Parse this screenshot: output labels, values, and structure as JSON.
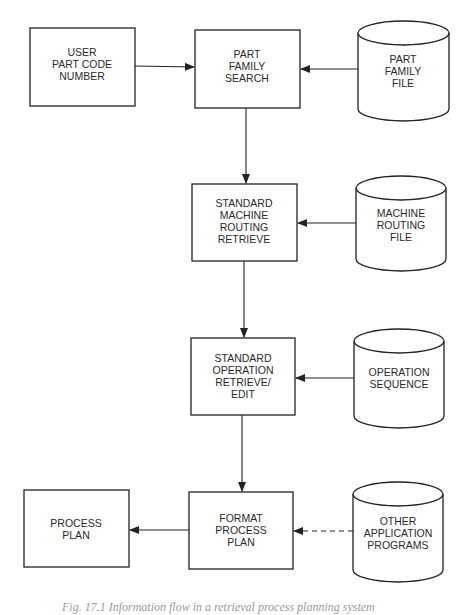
{
  "diagram": {
    "type": "flowchart",
    "nodes": [
      {
        "id": "user_part_code",
        "shape": "process",
        "lines": [
          "USER",
          "PART CODE",
          "NUMBER"
        ]
      },
      {
        "id": "part_family_search",
        "shape": "process",
        "lines": [
          "PART",
          "FAMILY",
          "SEARCH"
        ]
      },
      {
        "id": "part_family_file",
        "shape": "database",
        "lines": [
          "PART",
          "FAMILY",
          "FILE"
        ]
      },
      {
        "id": "std_machine_routing",
        "shape": "process",
        "lines": [
          "STANDARD",
          "MACHINE",
          "ROUTING",
          "RETRIEVE"
        ]
      },
      {
        "id": "machine_routing_file",
        "shape": "database",
        "lines": [
          "MACHINE",
          "ROUTING",
          "FILE"
        ]
      },
      {
        "id": "std_operation",
        "shape": "process",
        "lines": [
          "STANDARD",
          "OPERATION",
          "RETRIEVE/",
          "EDIT"
        ]
      },
      {
        "id": "operation_sequence",
        "shape": "database",
        "lines": [
          "OPERATION",
          "SEQUENCE"
        ]
      },
      {
        "id": "process_plan",
        "shape": "process",
        "lines": [
          "PROCESS",
          "PLAN"
        ]
      },
      {
        "id": "format_process_plan",
        "shape": "process",
        "lines": [
          "FORMAT",
          "PROCESS",
          "PLAN"
        ]
      },
      {
        "id": "other_app_programs",
        "shape": "database",
        "lines": [
          "OTHER",
          "APPLICATION",
          "PROGRAMS"
        ]
      }
    ],
    "edges": [
      {
        "from": "user_part_code",
        "to": "part_family_search",
        "style": "solid"
      },
      {
        "from": "part_family_file",
        "to": "part_family_search",
        "style": "solid"
      },
      {
        "from": "part_family_search",
        "to": "std_machine_routing",
        "style": "solid"
      },
      {
        "from": "machine_routing_file",
        "to": "std_machine_routing",
        "style": "solid"
      },
      {
        "from": "std_machine_routing",
        "to": "std_operation",
        "style": "solid"
      },
      {
        "from": "operation_sequence",
        "to": "std_operation",
        "style": "solid"
      },
      {
        "from": "std_operation",
        "to": "format_process_plan",
        "style": "solid"
      },
      {
        "from": "format_process_plan",
        "to": "process_plan",
        "style": "solid"
      },
      {
        "from": "other_app_programs",
        "to": "format_process_plan",
        "style": "dashed"
      }
    ]
  },
  "caption": "Fig. 17.1    Information flow in a retrieval process planning system"
}
